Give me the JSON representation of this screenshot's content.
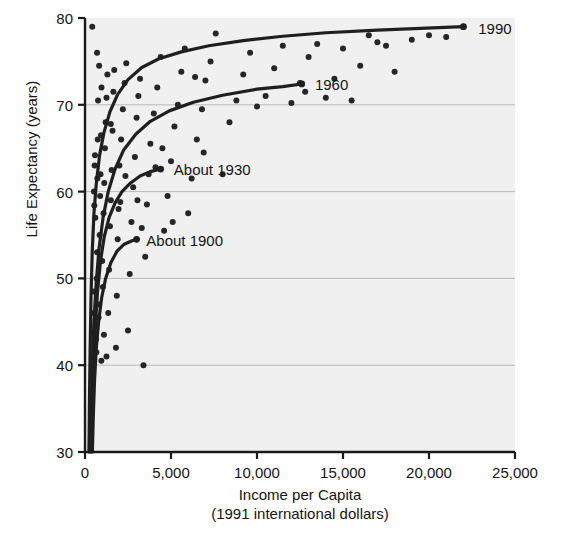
{
  "chart_data": {
    "type": "scatter",
    "title": "",
    "xlabel": "Income per Capita",
    "xlabel_sub": "(1991 international dollars)",
    "ylabel": "Life Expectancy (years)",
    "xlim": [
      0,
      25000
    ],
    "ylim": [
      30,
      80
    ],
    "xticks": [
      0,
      5000,
      10000,
      15000,
      20000,
      25000
    ],
    "xtick_labels": [
      "0",
      "5,000",
      "10,000",
      "15,000",
      "20,000",
      "25,000"
    ],
    "yticks": [
      30,
      40,
      50,
      60,
      70,
      80
    ],
    "ytick_labels": [
      "30",
      "40",
      "50",
      "60",
      "70",
      "80"
    ],
    "grid": "horizontal",
    "legend_position": "inline-curve-end",
    "plot_background": "#f0f0f0",
    "axis_color": "#1a1a1a",
    "grid_color": "#b9b9b9",
    "point_color": "#262626",
    "curve_color": "#1f1f1f",
    "series": [
      {
        "name": "1990",
        "label": "1990",
        "label_x": 22400,
        "label_y": 78.9,
        "curve": [
          [
            230,
            30.0
          ],
          [
            260,
            36.0
          ],
          [
            300,
            42.0
          ],
          [
            350,
            48.0
          ],
          [
            420,
            53.0
          ],
          [
            520,
            57.5
          ],
          [
            660,
            61.0
          ],
          [
            850,
            64.2
          ],
          [
            1100,
            66.8
          ],
          [
            1450,
            69.2
          ],
          [
            1900,
            71.2
          ],
          [
            2500,
            72.9
          ],
          [
            3300,
            74.3
          ],
          [
            4300,
            75.3
          ],
          [
            5600,
            76.1
          ],
          [
            7200,
            76.8
          ],
          [
            9200,
            77.4
          ],
          [
            11500,
            77.9
          ],
          [
            14000,
            78.3
          ],
          [
            17000,
            78.6
          ],
          [
            19500,
            78.8
          ],
          [
            22000,
            79.0
          ]
        ]
      },
      {
        "name": "1960",
        "label": "1960",
        "label_x": 12900,
        "label_y": 72.4,
        "curve": [
          [
            300,
            30.0
          ],
          [
            350,
            35.0
          ],
          [
            420,
            40.0
          ],
          [
            520,
            45.0
          ],
          [
            650,
            49.5
          ],
          [
            820,
            53.5
          ],
          [
            1050,
            57.0
          ],
          [
            1350,
            60.0
          ],
          [
            1750,
            62.6
          ],
          [
            2250,
            64.8
          ],
          [
            2950,
            66.6
          ],
          [
            3800,
            68.1
          ],
          [
            4900,
            69.3
          ],
          [
            6300,
            70.3
          ],
          [
            8000,
            71.1
          ],
          [
            10000,
            71.8
          ],
          [
            11500,
            72.1
          ],
          [
            12600,
            72.4
          ]
        ]
      },
      {
        "name": "About 1930",
        "label": "About 1930",
        "label_x": 4700,
        "label_y": 62.6,
        "curve": [
          [
            380,
            30.0
          ],
          [
            430,
            35.0
          ],
          [
            500,
            40.0
          ],
          [
            600,
            44.5
          ],
          [
            730,
            48.5
          ],
          [
            900,
            52.0
          ],
          [
            1120,
            54.8
          ],
          [
            1400,
            57.0
          ],
          [
            1750,
            58.7
          ],
          [
            2150,
            60.0
          ],
          [
            2650,
            61.0
          ],
          [
            3200,
            61.8
          ],
          [
            3800,
            62.3
          ],
          [
            4400,
            62.6
          ]
        ]
      },
      {
        "name": "About 1900",
        "label": "About 1900",
        "label_x": 3100,
        "label_y": 54.4,
        "curve": [
          [
            430,
            30.0
          ],
          [
            480,
            34.0
          ],
          [
            550,
            38.0
          ],
          [
            650,
            41.8
          ],
          [
            790,
            45.0
          ],
          [
            970,
            47.8
          ],
          [
            1200,
            50.0
          ],
          [
            1500,
            51.8
          ],
          [
            1850,
            53.1
          ],
          [
            2250,
            53.9
          ],
          [
            2700,
            54.3
          ],
          [
            3000,
            54.5
          ]
        ]
      }
    ],
    "points": [
      [
        420,
        79.0
      ],
      [
        480,
        48.5
      ],
      [
        500,
        46.0
      ],
      [
        520,
        60.0
      ],
      [
        540,
        58.4
      ],
      [
        560,
        63.0
      ],
      [
        580,
        64.2
      ],
      [
        600,
        57.0
      ],
      [
        620,
        44.5
      ],
      [
        640,
        43.0
      ],
      [
        660,
        41.5
      ],
      [
        680,
        50.0
      ],
      [
        700,
        53.0
      ],
      [
        720,
        61.5
      ],
      [
        740,
        66.0
      ],
      [
        760,
        70.5
      ],
      [
        790,
        45.5
      ],
      [
        820,
        47.0
      ],
      [
        850,
        55.0
      ],
      [
        880,
        59.5
      ],
      [
        900,
        62.0
      ],
      [
        930,
        66.5
      ],
      [
        960,
        72.0
      ],
      [
        1000,
        52.0
      ],
      [
        1040,
        49.0
      ],
      [
        1080,
        57.5
      ],
      [
        1120,
        61.0
      ],
      [
        1160,
        65.0
      ],
      [
        1200,
        68.0
      ],
      [
        1250,
        70.8
      ],
      [
        1300,
        73.5
      ],
      [
        1350,
        46.0
      ],
      [
        1400,
        51.0
      ],
      [
        1450,
        56.0
      ],
      [
        1500,
        59.0
      ],
      [
        1550,
        62.5
      ],
      [
        1600,
        67.0
      ],
      [
        1650,
        71.5
      ],
      [
        1700,
        74.0
      ],
      [
        1800,
        42.0
      ],
      [
        1850,
        48.0
      ],
      [
        1900,
        54.5
      ],
      [
        1950,
        58.0
      ],
      [
        2000,
        63.0
      ],
      [
        2100,
        66.0
      ],
      [
        2200,
        69.5
      ],
      [
        2300,
        72.5
      ],
      [
        2400,
        74.8
      ],
      [
        2500,
        44.0
      ],
      [
        2600,
        50.5
      ],
      [
        2700,
        56.5
      ],
      [
        2800,
        60.5
      ],
      [
        2900,
        64.0
      ],
      [
        3000,
        68.5
      ],
      [
        3100,
        71.0
      ],
      [
        3200,
        73.0
      ],
      [
        3400,
        40.0
      ],
      [
        3500,
        52.5
      ],
      [
        3600,
        58.5
      ],
      [
        3700,
        62.0
      ],
      [
        3800,
        65.5
      ],
      [
        4000,
        69.0
      ],
      [
        4200,
        72.0
      ],
      [
        4400,
        75.5
      ],
      [
        4600,
        55.5
      ],
      [
        4800,
        59.5
      ],
      [
        5000,
        63.5
      ],
      [
        5200,
        67.5
      ],
      [
        5400,
        70.0
      ],
      [
        5600,
        73.8
      ],
      [
        5800,
        76.5
      ],
      [
        6000,
        57.5
      ],
      [
        6200,
        61.5
      ],
      [
        6500,
        66.0
      ],
      [
        6800,
        69.5
      ],
      [
        7000,
        72.8
      ],
      [
        7300,
        75.0
      ],
      [
        7600,
        78.2
      ],
      [
        8000,
        62.0
      ],
      [
        8400,
        68.0
      ],
      [
        8800,
        70.5
      ],
      [
        9200,
        73.5
      ],
      [
        9600,
        76.0
      ],
      [
        10000,
        69.8
      ],
      [
        10500,
        71.0
      ],
      [
        11000,
        74.2
      ],
      [
        11500,
        76.8
      ],
      [
        12000,
        70.2
      ],
      [
        12500,
        72.5
      ],
      [
        12800,
        71.5
      ],
      [
        13000,
        75.5
      ],
      [
        13500,
        77.0
      ],
      [
        14000,
        70.8
      ],
      [
        14500,
        73.0
      ],
      [
        15000,
        76.5
      ],
      [
        15500,
        70.5
      ],
      [
        16000,
        74.5
      ],
      [
        16500,
        78.0
      ],
      [
        17000,
        77.2
      ],
      [
        17500,
        76.8
      ],
      [
        18000,
        73.8
      ],
      [
        19000,
        77.5
      ],
      [
        20000,
        78.0
      ],
      [
        21000,
        77.8
      ],
      [
        22000,
        79.0
      ],
      [
        700,
        76.0
      ],
      [
        820,
        74.5
      ],
      [
        950,
        40.5
      ],
      [
        1100,
        43.5
      ],
      [
        1250,
        41.0
      ],
      [
        1500,
        67.8
      ],
      [
        2050,
        58.8
      ],
      [
        2350,
        61.8
      ],
      [
        3050,
        59.0
      ],
      [
        3300,
        55.8
      ],
      [
        4100,
        62.8
      ],
      [
        4500,
        65.0
      ],
      [
        5100,
        56.5
      ],
      [
        6400,
        73.2
      ],
      [
        6900,
        64.5
      ]
    ]
  }
}
